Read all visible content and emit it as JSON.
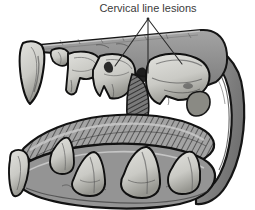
{
  "figure": {
    "kind": "anatomical-illustration",
    "style": "grayscale pen-and-ink shaded drawing",
    "background_color": "#ffffff"
  },
  "annotation": {
    "label": "Cervical line lesions",
    "label_x": 148,
    "label_y": 12,
    "leader_apex_x": 148,
    "leader_apex_y": 19,
    "leader_color": "#2b2b2b",
    "leader_targets": [
      {
        "name": "lesion-upper-premolar-left",
        "x": 115,
        "y": 66
      },
      {
        "name": "lesion-upper-premolar-mid",
        "x": 148,
        "y": 73
      },
      {
        "name": "lesion-upper-molar-right",
        "x": 182,
        "y": 64
      }
    ]
  },
  "palette": {
    "outline": "#1a1a1a",
    "gum_gray": "#9a9a9a",
    "gum_dark": "#6f6f6f",
    "tooth_light": "#d8d8d4",
    "tooth_mid": "#bdbdb8",
    "tooth_shadow": "#8d8d88",
    "tongue_gray": "#a3a3a3",
    "tongue_hatch": "#4a4a4a",
    "cheek_gray": "#8c8c8c",
    "palate_gray": "#8f8f8f",
    "shadow_deep": "#2e2e2e"
  },
  "parts": {
    "upper_jaw": "upper-jaw",
    "lower_jaw": "lower-jaw",
    "palate_band": "palate-band",
    "tongue": "tongue",
    "cheek": "cheek-commissure",
    "upper_canine": "upper-canine-tooth",
    "lower_canine": "lower-canine-tooth",
    "upper_incisors": "upper-incisor-teeth",
    "upper_premolars": "upper-premolar-teeth",
    "upper_molar": "upper-molar-tooth",
    "lower_premolars": "lower-premolar-teeth",
    "lower_molar": "lower-molar-tooth"
  }
}
